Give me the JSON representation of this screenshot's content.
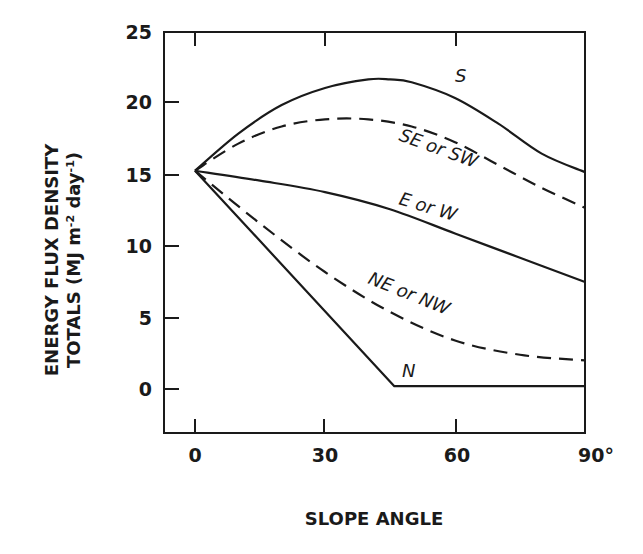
{
  "chart_data": {
    "type": "line",
    "title": "",
    "xlabel": "SLOPE ANGLE",
    "ylabel_line1": "ENERGY FLUX DENSITY",
    "ylabel_line2": "TOTALS (MJ m-2 day-1)",
    "xlim": [
      -7,
      90
    ],
    "ylim": [
      -3.1,
      25
    ],
    "x_ticks": [
      0,
      30,
      60,
      90
    ],
    "x_tick_labels": [
      "0",
      "30",
      "60",
      "90°"
    ],
    "y_ticks": [
      0,
      5,
      10,
      15,
      20,
      25
    ],
    "y_tick_labels": [
      "0",
      "5",
      "10",
      "15",
      "20",
      "25"
    ],
    "grid": false,
    "legend": "inline curve labels",
    "series": [
      {
        "name": "S",
        "style": "solid",
        "x": [
          0,
          10,
          20,
          30,
          40,
          45,
          50,
          60,
          70,
          80,
          90
        ],
        "y": [
          15.3,
          17.9,
          19.9,
          21.1,
          21.7,
          21.7,
          21.5,
          20.4,
          18.6,
          16.5,
          15.2
        ]
      },
      {
        "name": "SE or SW",
        "style": "dashed",
        "x": [
          0,
          10,
          20,
          30,
          40,
          50,
          60,
          70,
          80,
          90
        ],
        "y": [
          15.3,
          17.2,
          18.4,
          18.9,
          18.9,
          18.4,
          17.3,
          15.7,
          14.1,
          12.7
        ]
      },
      {
        "name": "E or W",
        "style": "solid",
        "x": [
          0,
          15,
          30,
          45,
          60,
          75,
          90
        ],
        "y": [
          15.3,
          14.6,
          13.8,
          12.6,
          10.9,
          9.2,
          7.5
        ]
      },
      {
        "name": "NE or NW",
        "style": "dashed",
        "x": [
          0,
          15,
          30,
          45,
          60,
          75,
          90
        ],
        "y": [
          15.3,
          11.6,
          8.2,
          5.4,
          3.4,
          2.4,
          2.0
        ]
      },
      {
        "name": "N",
        "style": "solid",
        "x": [
          0,
          46,
          90
        ],
        "y": [
          15.3,
          0.2,
          0.2
        ]
      }
    ]
  },
  "labels": {
    "ylabel_line1": "ENERGY FLUX DENSITY",
    "ylabel_line2_main": "TOTALS (MJ m",
    "ylabel_line2_sup1": "-2",
    "ylabel_line2_mid": " day",
    "ylabel_line2_sup2": "-1",
    "ylabel_line2_end": ")",
    "xlabel": "SLOPE ANGLE",
    "curve_S": "S",
    "curve_SE": "SE or SW",
    "curve_E": "E or W",
    "curve_NE": "NE or NW",
    "curve_N": "N",
    "xtick_0": "0",
    "xtick_30": "30",
    "xtick_60": "60",
    "xtick_90": "90°",
    "ytick_0": "0",
    "ytick_5": "5",
    "ytick_10": "10",
    "ytick_15": "15",
    "ytick_20": "20",
    "ytick_25": "25"
  }
}
